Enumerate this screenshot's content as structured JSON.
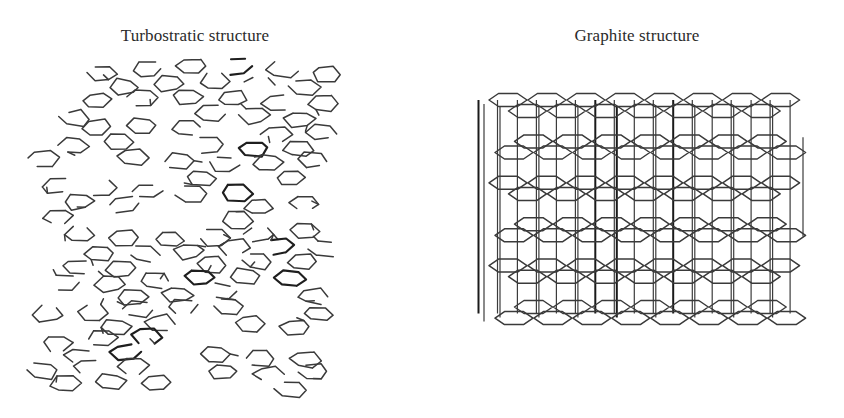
{
  "figure": {
    "background": "#ffffff",
    "line_color": "#3a3a3a",
    "panels": [
      {
        "id": "turbostratic",
        "title": "Turbostratic structure",
        "description": "Disordered, randomly rotated/offset stacked hexagonal carbon layers with broken bonds",
        "layers": 11,
        "hexagons_per_layer": 11,
        "bounds": {
          "x": 35,
          "y": 60,
          "width": 320,
          "height": 330
        }
      },
      {
        "id": "graphite",
        "title": "Graphite structure",
        "description": "Ordered AB-stacked hexagonal carbon layers joined by vertical interlayer lines in 3D perspective",
        "layers": 6,
        "hexagons_per_row": 8,
        "bounds": {
          "x": 480,
          "y": 88,
          "width": 325,
          "height": 237
        }
      }
    ]
  }
}
